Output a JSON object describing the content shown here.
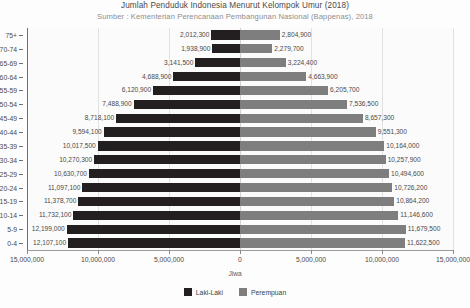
{
  "chart_data": {
    "type": "bar",
    "subtype": "population-pyramid",
    "title": "Jumlah Penduduk Indonesia Menurut Kelompok Umur (2018)",
    "subtitle": "Sumber : Kementerian Perencanaan Pembangunan Nasional (Bappenas), 2018",
    "xlabel": "Jiwa",
    "ylabel": "",
    "grid": true,
    "legend_position": "bottom",
    "xlim": [
      -15000000,
      15000000
    ],
    "xticks": [
      -15000000,
      -10000000,
      -5000000,
      0,
      5000000,
      10000000,
      15000000
    ],
    "xtick_labels": [
      "15,000,000",
      "10,000,000",
      "5,000,000",
      "0",
      "5,000,000",
      "10,000,000",
      "15,000,000"
    ],
    "categories": [
      "75+",
      "70-74",
      "65-69",
      "60-64",
      "55-59",
      "50-54",
      "45-49",
      "40-44",
      "35-39",
      "30-34",
      "25-29",
      "20-24",
      "15-19",
      "10-14",
      "5-9",
      "0-4"
    ],
    "series": [
      {
        "name": "Laki-Laki",
        "color": "#231f20",
        "side": "left",
        "values": [
          2012300,
          1938900,
          3141500,
          4688900,
          6120900,
          7488900,
          8718100,
          9594100,
          10017500,
          10270300,
          10630700,
          11097100,
          11378700,
          11732100,
          12199000,
          12107100
        ],
        "labels": [
          "2,012,300",
          "1,938,900",
          "3,141,500",
          "4,688,900",
          "6,120,900",
          "7,488,900",
          "8,718,100",
          "9,594,100",
          "10,017,500",
          "10,270,300",
          "10,630,700",
          "11,097,100",
          "11,378,700",
          "11,732,100",
          "12,199,000",
          "12,107,100"
        ]
      },
      {
        "name": "Perempuan",
        "color": "#7e7e7e",
        "side": "right",
        "values": [
          2804900,
          2279700,
          3224400,
          4663900,
          6205700,
          7536500,
          8657300,
          9551300,
          10164000,
          10257900,
          10494600,
          10726200,
          10864200,
          11146600,
          11679500,
          11622500
        ],
        "labels": [
          "2,804,900",
          "2,279,700",
          "3,224,400",
          "4,663,900",
          "6,205,700",
          "7,536,500",
          "8,657,300",
          "9,551,300",
          "10,164,000",
          "10,257,900",
          "10,494,600",
          "10,726,200",
          "10,864,200",
          "11,146,600",
          "11,679,500",
          "11,622,500"
        ]
      }
    ],
    "legend": [
      {
        "label": "Laki-Laki",
        "color": "#231f20"
      },
      {
        "label": "Perempuan",
        "color": "#7e7e7e"
      }
    ]
  }
}
